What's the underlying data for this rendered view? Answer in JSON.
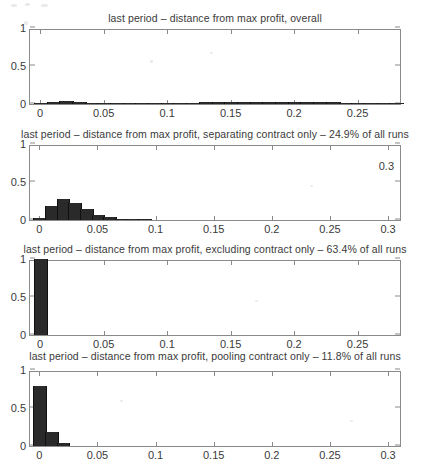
{
  "figure": {
    "width": 430,
    "height": 470,
    "background": "#ffffff",
    "bar_color": "#2a2a2a",
    "axis_color": "#8a8a8a",
    "text_color": "#3a3a3a"
  },
  "chart_data": [
    {
      "type": "bar",
      "title": "last period – distance from max profit, overall",
      "xlabel": "",
      "ylabel": "",
      "xlim": [
        -0.008,
        0.285
      ],
      "ylim": [
        0,
        1
      ],
      "grid": false,
      "legend": null,
      "xticks": [
        0,
        0.05,
        0.1,
        0.15,
        0.2,
        0.25
      ],
      "xtick_labels": [
        "0",
        "0.05",
        "0.1",
        "0.15",
        "0.2",
        "0.25"
      ],
      "yticks": [
        0,
        0.5,
        1
      ],
      "ytick_labels": [
        "0",
        "0.5",
        "1"
      ],
      "bin_width": 0.01,
      "x": [
        0.0,
        0.01,
        0.02,
        0.03,
        0.04,
        0.05,
        0.06,
        0.07,
        0.08,
        0.09,
        0.1,
        0.11,
        0.12,
        0.13,
        0.14,
        0.15,
        0.16,
        0.17,
        0.18,
        0.19,
        0.2,
        0.21,
        0.22,
        0.23,
        0.24,
        0.25,
        0.26,
        0.27,
        0.28
      ],
      "values": [
        0.012,
        0.028,
        0.042,
        0.032,
        0.016,
        0.01,
        0.006,
        0.004,
        0.004,
        0.003,
        0.003,
        0.004,
        0.008,
        0.024,
        0.02,
        0.03,
        0.03,
        0.033,
        0.026,
        0.025,
        0.024,
        0.024,
        0.022,
        0.02,
        0.018,
        0.014,
        0.008,
        0.004,
        0.002
      ]
    },
    {
      "type": "bar",
      "title": "last period – distance from max profit, separating contract only – 24.9% of all runs",
      "xlabel": "",
      "ylabel": "",
      "xlim": [
        -0.008,
        0.312
      ],
      "ylim": [
        0,
        1
      ],
      "grid": false,
      "legend": null,
      "annotation": "0.3",
      "xticks": [
        0,
        0.05,
        0.1,
        0.15,
        0.2,
        0.25,
        0.3
      ],
      "xtick_labels": [
        "0",
        "0.05",
        "0.1",
        "0.15",
        "0.2",
        "0.25",
        "0.3"
      ],
      "yticks": [
        0,
        0.5,
        1
      ],
      "ytick_labels": [
        "0",
        "0.5",
        "1"
      ],
      "bin_width": 0.01,
      "x": [
        0.0,
        0.01,
        0.02,
        0.03,
        0.04,
        0.05,
        0.06,
        0.07,
        0.08,
        0.09
      ],
      "values": [
        0.02,
        0.18,
        0.27,
        0.23,
        0.14,
        0.07,
        0.035,
        0.018,
        0.012,
        0.004
      ]
    },
    {
      "type": "bar",
      "title": "last period – distance from max profit, excluding contract only – 63.4% of all runs",
      "xlabel": "",
      "ylabel": "",
      "xlim": [
        -0.008,
        0.285
      ],
      "ylim": [
        0,
        1
      ],
      "grid": false,
      "legend": null,
      "xticks": [
        0,
        0.05,
        0.1,
        0.15,
        0.2,
        0.25
      ],
      "xtick_labels": [
        "0",
        "0.05",
        "0.1",
        "0.15",
        "0.2",
        "0.25"
      ],
      "yticks": [
        0,
        0.5,
        1
      ],
      "ytick_labels": [
        "0",
        "0.5",
        "1"
      ],
      "bin_width": 0.01,
      "x": [
        0.0
      ],
      "values": [
        1.0
      ]
    },
    {
      "type": "bar",
      "title": "last period – distance from max profit, pooling contract only – 11.8% of all runs",
      "xlabel": "",
      "ylabel": "",
      "xlim": [
        -0.008,
        0.312
      ],
      "ylim": [
        0,
        1
      ],
      "grid": false,
      "legend": null,
      "xticks": [
        0,
        0.05,
        0.1,
        0.15,
        0.2,
        0.25,
        0.3
      ],
      "xtick_labels": [
        "0",
        "0.05",
        "0.1",
        "0.15",
        "0.2",
        "0.25",
        "0.3"
      ],
      "yticks": [
        0,
        0.5,
        1
      ],
      "ytick_labels": [
        "0",
        "0.5",
        "1"
      ],
      "bin_width": 0.01,
      "x": [
        0.0,
        0.01,
        0.02
      ],
      "values": [
        0.79,
        0.19,
        0.035
      ]
    }
  ],
  "panel_geometry": [
    {
      "title_top": 12,
      "box_left": 29,
      "box_top": 29,
      "box_width": 372,
      "box_height": 76
    },
    {
      "title_top": 128,
      "box_left": 29,
      "box_top": 145,
      "box_width": 372,
      "box_height": 76
    },
    {
      "title_top": 243,
      "box_left": 29,
      "box_top": 260,
      "box_width": 372,
      "box_height": 76
    },
    {
      "title_top": 350,
      "box_left": 29,
      "box_top": 371,
      "box_width": 372,
      "box_height": 76
    }
  ],
  "speckles": [
    {
      "left": 11,
      "top": 4,
      "width": 6,
      "height": 3
    },
    {
      "left": 25,
      "top": 3,
      "width": 5,
      "height": 3
    },
    {
      "left": 41,
      "top": 4,
      "width": 7,
      "height": 3
    },
    {
      "left": 24,
      "top": 21,
      "width": 4,
      "height": 4
    },
    {
      "left": 150,
      "top": 60,
      "width": 3,
      "height": 3
    },
    {
      "left": 210,
      "top": 52,
      "width": 3,
      "height": 2
    },
    {
      "left": 310,
      "top": 185,
      "width": 3,
      "height": 2
    },
    {
      "left": 255,
      "top": 300,
      "width": 3,
      "height": 2
    },
    {
      "left": 120,
      "top": 400,
      "width": 3,
      "height": 2
    },
    {
      "left": 350,
      "top": 420,
      "width": 3,
      "height": 2
    }
  ]
}
